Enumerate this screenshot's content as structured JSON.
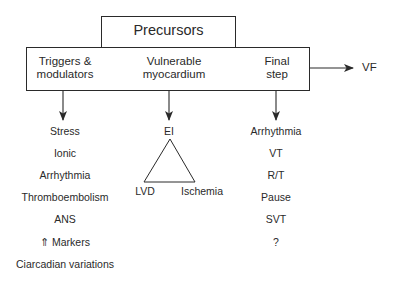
{
  "diagram": {
    "header": {
      "label": "Precursors"
    },
    "stages": [
      {
        "label_line1": "Triggers &",
        "label_line2": "modulators"
      },
      {
        "label_line1": "Vulnerable",
        "label_line2": "myocardium"
      },
      {
        "label_line1": "Final",
        "label_line2": "step"
      }
    ],
    "outcome": {
      "label": "VF"
    },
    "triggers_list": [
      "Stress",
      "Ionic",
      "Arrhythmia",
      "Thromboembolism",
      "ANS",
      "⇑ Markers",
      "Ciarcadian variations"
    ],
    "vulnerable": {
      "apex": "EI",
      "left": "LVD",
      "right": "Ischemia"
    },
    "final_step_list": [
      "Arrhythmia",
      "VT",
      "R/T",
      "Pause",
      "SVT",
      "?"
    ],
    "colors": {
      "stroke": "#2a2a2a",
      "background": "#ffffff"
    }
  }
}
